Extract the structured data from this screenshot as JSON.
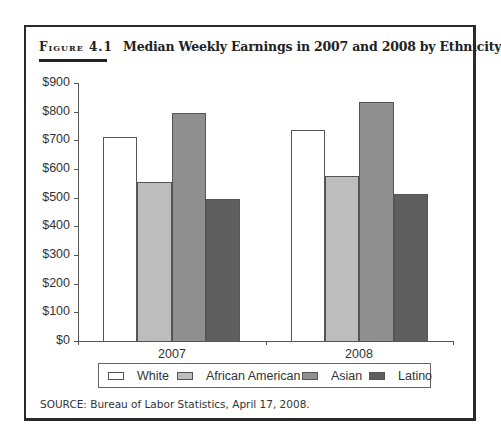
{
  "figure": {
    "label": "Figure 4.1",
    "title": "Median Weekly Earnings in 2007 and 2008 by Ethnicity",
    "source": "SOURCE: Bureau of Labor Statistics, April 17, 2008."
  },
  "y_axis": {
    "ticks": [
      "$0",
      "$100",
      "$200",
      "$300",
      "$400",
      "$500",
      "$600",
      "$700",
      "$800",
      "$900"
    ]
  },
  "legend": {
    "items": [
      {
        "label": "White",
        "color": "#ffffff"
      },
      {
        "label": "African American",
        "color": "#bdbdbd"
      },
      {
        "label": "Asian",
        "color": "#8f8f8f"
      },
      {
        "label": "Latino",
        "color": "#5f5f5f"
      }
    ]
  },
  "chart_data": {
    "type": "bar",
    "title": "Median Weekly Earnings in 2007 and 2008 by Ethnicity",
    "categories": [
      "2007",
      "2008"
    ],
    "series": [
      {
        "name": "White",
        "values": [
          711,
          736
        ],
        "color": "#ffffff"
      },
      {
        "name": "African American",
        "values": [
          555,
          575
        ],
        "color": "#bdbdbd"
      },
      {
        "name": "Asian",
        "values": [
          795,
          834
        ],
        "color": "#8f8f8f"
      },
      {
        "name": "Latino",
        "values": [
          495,
          513
        ],
        "color": "#5f5f5f"
      }
    ],
    "xlabel": "",
    "ylabel": "",
    "ylim": [
      0,
      900
    ],
    "ytick_step": 100,
    "grid": false,
    "legend_position": "bottom",
    "source": "SOURCE: Bureau of Labor Statistics, April 17, 2008."
  }
}
